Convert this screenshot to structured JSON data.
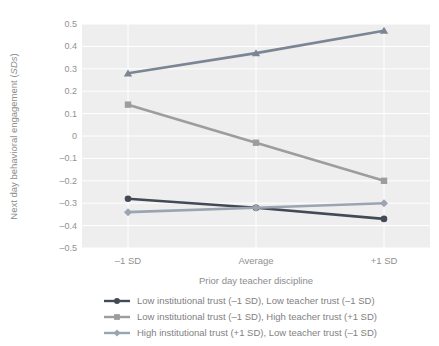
{
  "chart_data": {
    "type": "line",
    "categories": [
      "–1 SD",
      "Average",
      "+1 SD"
    ],
    "series": [
      {
        "name": "Low institutional trust (–1 SD), Low teacher trust (–1 SD)",
        "marker": "circle",
        "color": "#424a55",
        "values": [
          -0.28,
          -0.32,
          -0.37
        ],
        "in_visible_legend": true
      },
      {
        "name": "Low institutional trust (–1 SD), High teacher trust (+1 SD)",
        "marker": "square",
        "color": "#9c9d9f",
        "values": [
          0.14,
          -0.03,
          -0.2
        ],
        "in_visible_legend": true
      },
      {
        "name": "High institutional trust (+1 SD), Low teacher trust (–1 SD)",
        "marker": "diamond",
        "color": "#9ba4b1",
        "values": [
          -0.34,
          -0.32,
          -0.3
        ],
        "in_visible_legend": true
      },
      {
        "name": "",
        "marker": "triangle",
        "color": "#7b8594",
        "values": [
          0.28,
          0.37,
          0.47
        ],
        "in_visible_legend": false
      }
    ],
    "title": "",
    "xlabel": "Prior day teacher discipline",
    "ylabel": "Next day behavioral engagement (SDs)",
    "ylabel_parts": {
      "prefix": "Next day behavioral engagement (",
      "italic": "SDs",
      "suffix": ")"
    },
    "ylim": [
      -0.5,
      0.5
    ],
    "y_ticks": [
      {
        "value": 0.5,
        "label": "0.5"
      },
      {
        "value": 0.4,
        "label": "0.4"
      },
      {
        "value": 0.3,
        "label": "0.3"
      },
      {
        "value": 0.2,
        "label": "0.2"
      },
      {
        "value": 0.1,
        "label": "0.1"
      },
      {
        "value": 0,
        "label": "0"
      },
      {
        "value": -0.1,
        "label": "–0.1"
      },
      {
        "value": -0.2,
        "label": "–0.2"
      },
      {
        "value": -0.3,
        "label": "–0.3"
      },
      {
        "value": -0.4,
        "label": "–0.4"
      },
      {
        "value": -0.5,
        "label": "–0.5"
      }
    ],
    "grid": true,
    "legend_position": "bottom-left"
  },
  "colors": {
    "panel": "#eeeeef",
    "grid": "#ffffff",
    "tick_text": "#8f9193",
    "axis_text": "#8a8c8e",
    "legend_text": "#7f8183"
  }
}
